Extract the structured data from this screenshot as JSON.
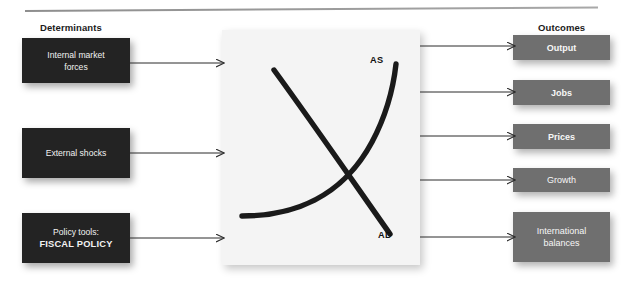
{
  "headers": {
    "left": "Determinants",
    "right": "Outcomes"
  },
  "determinants": [
    {
      "id": "internal",
      "label": "Internal market\nforces"
    },
    {
      "id": "external",
      "label": "External shocks"
    },
    {
      "id": "policy",
      "label_line1": "Policy tools:",
      "label_line2": "FISCAL POLICY"
    }
  ],
  "outcomes": [
    {
      "id": "output",
      "label": "Output"
    },
    {
      "id": "jobs",
      "label": "Jobs"
    },
    {
      "id": "prices",
      "label": "Prices"
    },
    {
      "id": "growth",
      "label": "Growth"
    },
    {
      "id": "intl",
      "label": "International\nbalances"
    }
  ],
  "center": {
    "curves": [
      {
        "name": "AS",
        "label": "AS"
      },
      {
        "name": "AD",
        "label": "AD"
      }
    ]
  },
  "colors": {
    "determinant_box": "#232323",
    "outcome_box": "#6f6f6f",
    "center_panel": "#f4f4f4",
    "curve": "#1a1a1a",
    "arrow": "#2b2b2b",
    "divider": "#9a9a9a",
    "text_light": "#f4f4f4",
    "text_dark": "#1b1b1b"
  }
}
